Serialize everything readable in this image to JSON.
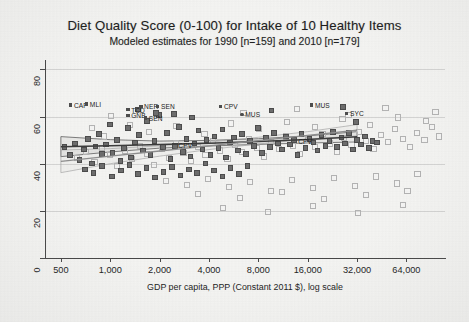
{
  "chart_data": {
    "type": "scatter",
    "title": "Diet Quality Score (0-100) for Intake of 10 Healthy Items",
    "subtitle": "Modeled estimates for 1990 [n=159] and 2010 [n=179]",
    "xlabel": "GDP per capita, PPP (Constant 2011 $), log scale",
    "ylabel": "",
    "xscale": "log",
    "xlim": [
      400,
      110000
    ],
    "ylim": [
      0,
      84
    ],
    "xticks": [
      500,
      1000,
      2000,
      4000,
      8000,
      16000,
      32000,
      64000
    ],
    "xticklabels": [
      "500",
      "1,000",
      "2,000",
      "4,000",
      "8,000",
      "16,000",
      "32,000",
      "64,000"
    ],
    "yticks": [
      0,
      20,
      40,
      60,
      80
    ],
    "yticklabels": [
      "0",
      "20",
      "40",
      "60",
      "80"
    ],
    "grid": "horizontal",
    "legend": "none",
    "series": [
      {
        "name": "1990",
        "marker": "filled-square",
        "color": "#6d6d6d",
        "n": 159,
        "points": [
          [
            520,
            47.5
          ],
          [
            560,
            44.0
          ],
          [
            600,
            49.0
          ],
          [
            640,
            42.0
          ],
          [
            680,
            46.5
          ],
          [
            720,
            51.0
          ],
          [
            760,
            40.5
          ],
          [
            800,
            47.8
          ],
          [
            840,
            53.0
          ],
          [
            880,
            44.5
          ],
          [
            930,
            48.5
          ],
          [
            980,
            57.0
          ],
          [
            1020,
            45.0
          ],
          [
            1080,
            50.5
          ],
          [
            1140,
            41.5
          ],
          [
            1200,
            47.0
          ],
          [
            1260,
            55.5
          ],
          [
            1320,
            43.0
          ],
          [
            1400,
            49.5
          ],
          [
            1480,
            52.5
          ],
          [
            1560,
            46.0
          ],
          [
            1650,
            58.5
          ],
          [
            1740,
            44.0
          ],
          [
            1840,
            50.0
          ],
          [
            1950,
            61.0
          ],
          [
            2060,
            47.5
          ],
          [
            2180,
            53.5
          ],
          [
            2300,
            42.5
          ],
          [
            2440,
            48.0
          ],
          [
            2580,
            56.0
          ],
          [
            2730,
            45.5
          ],
          [
            2880,
            51.0
          ],
          [
            3050,
            43.5
          ],
          [
            3220,
            49.0
          ],
          [
            3410,
            54.5
          ],
          [
            3600,
            46.5
          ],
          [
            3810,
            50.5
          ],
          [
            4030,
            44.0
          ],
          [
            4260,
            52.0
          ],
          [
            4500,
            47.0
          ],
          [
            4760,
            55.0
          ],
          [
            5030,
            43.0
          ],
          [
            5320,
            49.5
          ],
          [
            5620,
            51.5
          ],
          [
            5950,
            46.0
          ],
          [
            6290,
            53.0
          ],
          [
            6650,
            44.5
          ],
          [
            7030,
            50.0
          ],
          [
            7430,
            48.0
          ],
          [
            7860,
            55.5
          ],
          [
            8310,
            45.0
          ],
          [
            8780,
            51.5
          ],
          [
            9280,
            47.5
          ],
          [
            9810,
            53.5
          ],
          [
            10400,
            49.0
          ],
          [
            11000,
            46.5
          ],
          [
            11600,
            52.0
          ],
          [
            12300,
            48.5
          ],
          [
            13000,
            50.5
          ],
          [
            13700,
            44.0
          ],
          [
            14500,
            53.0
          ],
          [
            15300,
            47.0
          ],
          [
            16200,
            51.0
          ],
          [
            17100,
            49.5
          ],
          [
            18100,
            46.0
          ],
          [
            19100,
            52.5
          ],
          [
            20200,
            48.0
          ],
          [
            21400,
            50.0
          ],
          [
            22600,
            54.0
          ],
          [
            23900,
            47.5
          ],
          [
            25300,
            51.5
          ],
          [
            26700,
            49.0
          ],
          [
            28200,
            53.5
          ],
          [
            29800,
            46.5
          ],
          [
            31500,
            50.5
          ],
          [
            33300,
            48.5
          ],
          [
            35200,
            52.0
          ],
          [
            37200,
            47.0
          ],
          [
            39300,
            50.0
          ],
          [
            41600,
            49.5
          ],
          [
            690,
            38.0
          ],
          [
            780,
            36.5
          ],
          [
            880,
            39.5
          ],
          [
            1010,
            35.0
          ],
          [
            1150,
            37.5
          ],
          [
            1290,
            40.0
          ],
          [
            1460,
            36.0
          ],
          [
            1640,
            38.5
          ],
          [
            1850,
            34.5
          ],
          [
            2080,
            37.0
          ],
          [
            2340,
            39.0
          ],
          [
            2640,
            35.5
          ],
          [
            2970,
            38.0
          ],
          [
            3340,
            36.5
          ],
          [
            3760,
            40.5
          ],
          [
            4230,
            37.5
          ],
          [
            4760,
            35.0
          ],
          [
            5350,
            38.5
          ],
          [
            6020,
            36.0
          ],
          [
            6770,
            39.5
          ],
          [
            1450,
            63.5
          ],
          [
            1880,
            62.0
          ],
          [
            2420,
            61.5
          ],
          [
            3100,
            60.0
          ],
          [
            9500,
            63.0
          ],
          [
            26000,
            64.5
          ],
          [
            31000,
            58.0
          ]
        ]
      },
      {
        "name": "2010",
        "marker": "open-square",
        "color": "#b4b4b4",
        "n": 179,
        "points": [
          [
            620,
            43.0
          ],
          [
            700,
            45.5
          ],
          [
            790,
            41.0
          ],
          [
            880,
            47.0
          ],
          [
            980,
            44.0
          ],
          [
            1090,
            39.5
          ],
          [
            1210,
            46.0
          ],
          [
            1340,
            42.5
          ],
          [
            1490,
            48.0
          ],
          [
            1650,
            44.5
          ],
          [
            1830,
            40.0
          ],
          [
            2030,
            46.5
          ],
          [
            2250,
            43.0
          ],
          [
            2490,
            49.0
          ],
          [
            2760,
            45.0
          ],
          [
            3060,
            41.5
          ],
          [
            3390,
            47.5
          ],
          [
            3760,
            44.0
          ],
          [
            4160,
            50.0
          ],
          [
            4610,
            46.0
          ],
          [
            5110,
            42.5
          ],
          [
            5660,
            48.5
          ],
          [
            6270,
            45.5
          ],
          [
            6950,
            51.0
          ],
          [
            7700,
            47.0
          ],
          [
            8530,
            43.5
          ],
          [
            9450,
            49.5
          ],
          [
            10500,
            46.5
          ],
          [
            11600,
            52.0
          ],
          [
            12900,
            48.0
          ],
          [
            14200,
            44.5
          ],
          [
            15800,
            50.5
          ],
          [
            17500,
            47.5
          ],
          [
            19400,
            53.0
          ],
          [
            21500,
            49.0
          ],
          [
            23800,
            45.5
          ],
          [
            26400,
            51.5
          ],
          [
            29200,
            48.5
          ],
          [
            32400,
            54.0
          ],
          [
            35900,
            50.0
          ],
          [
            39700,
            46.5
          ],
          [
            44000,
            52.5
          ],
          [
            48800,
            49.5
          ],
          [
            54000,
            55.0
          ],
          [
            59900,
            51.0
          ],
          [
            66300,
            47.5
          ],
          [
            73500,
            53.5
          ],
          [
            81400,
            50.5
          ],
          [
            90200,
            56.0
          ],
          [
            99900,
            52.0
          ],
          [
            2150,
            33.0
          ],
          [
            2900,
            31.5
          ],
          [
            3900,
            34.0
          ],
          [
            5200,
            30.5
          ],
          [
            7000,
            32.5
          ],
          [
            9400,
            29.0
          ],
          [
            12600,
            33.5
          ],
          [
            16900,
            30.0
          ],
          [
            22700,
            34.5
          ],
          [
            30500,
            31.0
          ],
          [
            41000,
            35.0
          ],
          [
            55000,
            32.0
          ],
          [
            73800,
            36.0
          ],
          [
            3400,
            27.5
          ],
          [
            6100,
            26.0
          ],
          [
            11000,
            28.5
          ],
          [
            19800,
            25.5
          ],
          [
            35600,
            27.0
          ],
          [
            64000,
            29.0
          ],
          [
            4800,
            21.5
          ],
          [
            9000,
            20.0
          ],
          [
            17000,
            22.5
          ],
          [
            32000,
            19.5
          ],
          [
            60000,
            23.0
          ],
          [
            1700,
            54.0
          ],
          [
            2500,
            56.5
          ],
          [
            3700,
            53.0
          ],
          [
            5400,
            57.5
          ],
          [
            8000,
            55.0
          ],
          [
            11800,
            58.0
          ],
          [
            17400,
            56.0
          ],
          [
            25700,
            59.5
          ],
          [
            37900,
            57.0
          ],
          [
            56000,
            60.0
          ],
          [
            83000,
            58.5
          ],
          [
            6400,
            62.0
          ],
          [
            13500,
            63.5
          ],
          [
            28000,
            61.0
          ],
          [
            47000,
            64.0
          ],
          [
            95000,
            62.5
          ],
          [
            900,
            52.0
          ],
          [
            1300,
            57.0
          ],
          [
            760,
            55.5
          ],
          [
            1000,
            60.5
          ]
        ]
      }
    ],
    "trend_lines": [
      {
        "name": "1990 fitted",
        "style": "solid-dark",
        "points": [
          [
            500,
            47.2
          ],
          [
            1000,
            47.6
          ],
          [
            2000,
            48.1
          ],
          [
            4000,
            48.7
          ],
          [
            8000,
            49.4
          ],
          [
            16000,
            50.3
          ],
          [
            32000,
            51.4
          ]
        ],
        "ci_upper": [
          [
            500,
            51.5
          ],
          [
            1000,
            50.2
          ],
          [
            2000,
            49.6
          ],
          [
            4000,
            49.9
          ],
          [
            8000,
            50.6
          ],
          [
            16000,
            51.8
          ],
          [
            32000,
            53.6
          ]
        ],
        "ci_lower": [
          [
            500,
            43.0
          ],
          [
            1000,
            45.0
          ],
          [
            2000,
            46.6
          ],
          [
            4000,
            47.5
          ],
          [
            8000,
            48.2
          ],
          [
            16000,
            48.8
          ],
          [
            32000,
            49.2
          ]
        ]
      },
      {
        "name": "2010 fitted",
        "style": "solid-light",
        "points": [
          [
            500,
            41.0
          ],
          [
            1000,
            43.2
          ],
          [
            2000,
            45.4
          ],
          [
            4000,
            47.6
          ],
          [
            8000,
            49.8
          ],
          [
            16000,
            52.0
          ],
          [
            32000,
            54.2
          ]
        ],
        "ci_upper": [
          [
            500,
            45.8
          ],
          [
            1000,
            46.4
          ],
          [
            2000,
            47.6
          ],
          [
            4000,
            49.2
          ],
          [
            8000,
            51.2
          ],
          [
            16000,
            53.6
          ],
          [
            32000,
            56.6
          ]
        ],
        "ci_lower": [
          [
            500,
            36.2
          ],
          [
            1000,
            40.0
          ],
          [
            2000,
            43.2
          ],
          [
            4000,
            46.0
          ],
          [
            8000,
            48.4
          ],
          [
            16000,
            50.4
          ],
          [
            32000,
            51.8
          ]
        ]
      }
    ],
    "annotations": [
      {
        "label": "CAF",
        "x": 560,
        "y": 65.0,
        "marker": "filled-square"
      },
      {
        "label": "MLI",
        "x": 700,
        "y": 65.5,
        "marker": "filled-square"
      },
      {
        "label": "TCD",
        "x": 1250,
        "y": 63.0,
        "marker": "filled-square"
      },
      {
        "label": "NER",
        "x": 1500,
        "y": 64.5,
        "marker": "filled-square"
      },
      {
        "label": "SEN",
        "x": 1900,
        "y": 64.5,
        "marker": "filled-square"
      },
      {
        "label": "GNB",
        "x": 1250,
        "y": 60.5,
        "marker": "filled-square"
      },
      {
        "label": "SEN",
        "x": 1600,
        "y": 59.5,
        "marker": "filled-square"
      },
      {
        "label": "CPV",
        "x": 4600,
        "y": 64.5,
        "marker": "filled-square"
      },
      {
        "label": "MUS",
        "x": 6200,
        "y": 61.0,
        "marker": "filled-circle"
      },
      {
        "label": "MUS",
        "x": 16500,
        "y": 65.0,
        "marker": "filled-square"
      },
      {
        "label": "SYC",
        "x": 27000,
        "y": 61.5,
        "marker": "filled-square"
      },
      {
        "label": "CPV",
        "x": 2600,
        "y": 48.0,
        "marker": "none"
      },
      {
        "label": "CPV",
        "x": 14000,
        "y": 49.5,
        "marker": "none"
      }
    ]
  }
}
